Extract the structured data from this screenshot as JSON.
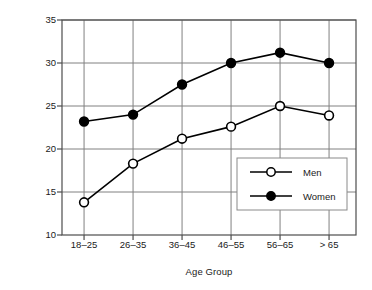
{
  "chart_data": {
    "type": "line",
    "title": "",
    "xlabel": "Age Group",
    "ylabel": "Percent Body Fat (%)",
    "categories": [
      "18–25",
      "26–35",
      "36–45",
      "46–55",
      "56–65",
      "> 65"
    ],
    "series": [
      {
        "name": "Men",
        "marker": "open-circle",
        "color": "#000000",
        "values": [
          13.8,
          18.3,
          21.2,
          22.6,
          25.0,
          23.9
        ]
      },
      {
        "name": "Women",
        "marker": "filled-circle",
        "color": "#000000",
        "values": [
          23.2,
          24.0,
          27.5,
          30.0,
          31.2,
          30.0
        ]
      }
    ],
    "ylim": [
      10,
      35
    ],
    "yticks": [
      10,
      15,
      20,
      25,
      30,
      35
    ],
    "ytick_labels": [
      "10",
      "15",
      "20",
      "25",
      "30",
      "35"
    ],
    "grid": true,
    "grid_color": "#808080",
    "axis_color": "#4d4d4d",
    "legend_position": "lower-right-inside",
    "legend_entries": [
      "Men",
      "Women"
    ]
  }
}
